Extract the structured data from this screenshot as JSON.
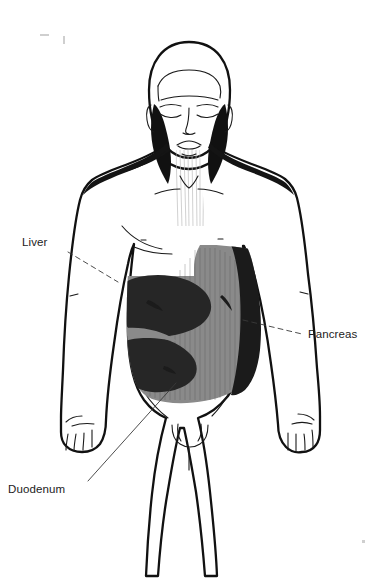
{
  "figure": {
    "orientation": "anterior",
    "background_color": "#ffffff",
    "outline_color": "#111111"
  },
  "labels": [
    {
      "id": "liver",
      "text": "Liver",
      "x": 22,
      "y": 242,
      "leader": "dashed",
      "points_to": "dark left-upper abdominal region"
    },
    {
      "id": "pancreas",
      "text": "Pancreas",
      "x": 308,
      "y": 334,
      "leader": "dashed",
      "points_to": "dark right-flank wedge region"
    },
    {
      "id": "duodenum",
      "text": "Duodenum",
      "x": 8,
      "y": 489,
      "leader": "solid",
      "points_to": "lower dark abdominal lobe"
    }
  ],
  "regions": [
    {
      "id": "abdomen-field",
      "name": "abdominal shading field",
      "color": "#8a8a8a",
      "tone": "mid-gray"
    },
    {
      "id": "liver-mass",
      "name": "liver mass",
      "color": "#262626",
      "tone": "dark"
    },
    {
      "id": "duodenum-lobe",
      "name": "duodenum lobe",
      "color": "#262626",
      "tone": "dark"
    },
    {
      "id": "pancreas-wedge",
      "name": "pancreas wedge",
      "color": "#1b1b1b",
      "tone": "darkest"
    }
  ],
  "anatomy_features": [
    "head with closed eyes",
    "hairline",
    "ears",
    "nose",
    "mouth",
    "neck with sternocleidomastoid shading",
    "clavicles",
    "shoulders with dark trapezius shading",
    "pectoral contour lines",
    "arms at sides",
    "hands with fingers",
    "pelvis and groin",
    "legs extending to lower edge"
  ]
}
